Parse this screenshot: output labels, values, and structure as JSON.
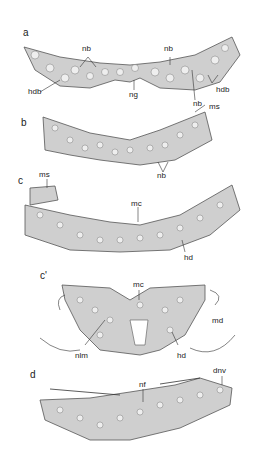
{
  "figure": {
    "panels": [
      {
        "id": "a",
        "label": "a",
        "annotations": [
          "nb",
          "nb",
          "hdb",
          "ng",
          "nb",
          "ms",
          "hdb"
        ]
      },
      {
        "id": "b",
        "label": "b",
        "annotations": [
          "ms",
          "nb"
        ]
      },
      {
        "id": "c",
        "label": "c",
        "annotations": [
          "ms",
          "mc",
          "hd"
        ]
      },
      {
        "id": "c_prime",
        "label": "c'",
        "annotations": [
          "mc",
          "md",
          "nlm",
          "hd"
        ]
      },
      {
        "id": "d",
        "label": "d",
        "annotations": [
          "nf",
          "dnv"
        ]
      }
    ]
  },
  "labels": {
    "a": {
      "panel": "a",
      "nb1": "nb",
      "nb2": "nb",
      "hdb1": "hdb",
      "ng": "ng",
      "nb3": "nb",
      "ms": "ms",
      "hdb2": "hdb"
    },
    "b": {
      "panel": "b",
      "nb": "nb"
    },
    "c": {
      "panel": "c",
      "ms": "ms",
      "mc": "mc",
      "hd": "hd"
    },
    "cp": {
      "panel": "c'",
      "mc": "mc",
      "md": "md",
      "nlm": "nlm",
      "hd": "hd"
    },
    "d": {
      "panel": "d",
      "nf": "nf",
      "dnv": "dnv"
    }
  }
}
